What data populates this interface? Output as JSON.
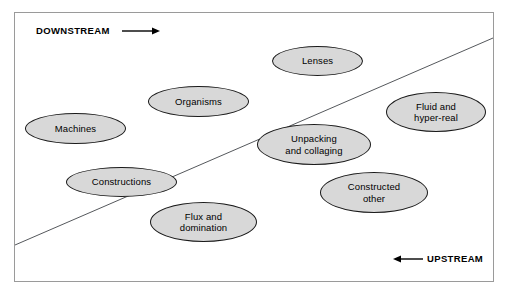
{
  "diagram": {
    "frame": {
      "border_color": "#9a9a9a"
    },
    "divider": {
      "name": "diagonal-divider-line",
      "color": "#55585c",
      "x1": 15,
      "y1": 245,
      "x2": 493,
      "y2": 38
    },
    "axis_labels": [
      {
        "id": "downstream",
        "text": "DOWNSTREAM",
        "arrow_direction": "right",
        "x": 36,
        "y": 27
      },
      {
        "id": "upstream",
        "text": "UPSTREAM",
        "arrow_direction": "left",
        "x": 427,
        "y": 255
      }
    ],
    "nodes": [
      {
        "id": "machines",
        "label": "Machines",
        "x": 25,
        "y": 113,
        "w": 101,
        "h": 31
      },
      {
        "id": "organisms",
        "label": "Organisms",
        "x": 148,
        "y": 86,
        "w": 101,
        "h": 31
      },
      {
        "id": "lenses",
        "label": "Lenses",
        "x": 272,
        "y": 46,
        "w": 91,
        "h": 30
      },
      {
        "id": "fluid",
        "label": "Fluid and\nhyper-real",
        "x": 386,
        "y": 92,
        "w": 100,
        "h": 40
      },
      {
        "id": "unpacking",
        "label": "Unpacking\nand collaging",
        "x": 257,
        "y": 124,
        "w": 114,
        "h": 41
      },
      {
        "id": "constructions",
        "label": "Constructions",
        "x": 66,
        "y": 167,
        "w": 111,
        "h": 30
      },
      {
        "id": "constructed_other",
        "label": "Constructed\nother",
        "x": 320,
        "y": 172,
        "w": 108,
        "h": 41
      },
      {
        "id": "flux",
        "label": "Flux and\ndomination",
        "x": 150,
        "y": 202,
        "w": 107,
        "h": 40
      }
    ],
    "fill_color": "#d8d8d8",
    "stroke_color": "#1a1a1a"
  }
}
